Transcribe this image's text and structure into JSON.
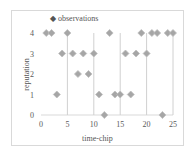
{
  "chart_data": {
    "type": "scatter",
    "title": "",
    "xlabel": "time-chip",
    "ylabel": "reputation",
    "xlim": [
      0,
      25
    ],
    "ylim": [
      0,
      4
    ],
    "xticks": [
      0,
      5,
      10,
      15,
      20,
      25
    ],
    "yticks": [
      0,
      1,
      2,
      3,
      4
    ],
    "grid": "vertical lines at x=5,10,15,20,25",
    "legend": {
      "position": "top",
      "entries": [
        "observations"
      ]
    },
    "marker": "diamond",
    "series": [
      {
        "name": "observations",
        "color": "#a6a6a6",
        "x": [
          1,
          2,
          3,
          4,
          5,
          6,
          7,
          8,
          9,
          10,
          11,
          12,
          13,
          14,
          15,
          16,
          17,
          18,
          19,
          20,
          21,
          22,
          23,
          24,
          25
        ],
        "y": [
          4,
          4,
          1,
          3,
          4,
          3,
          2,
          3,
          2,
          3,
          1,
          0,
          4,
          1,
          1,
          3,
          1,
          3,
          4,
          3,
          4,
          4,
          0,
          4,
          4
        ]
      }
    ]
  },
  "legend_label": "◆ observations",
  "axis": {
    "xlabel": "time-chip",
    "ylabel": "reputation"
  }
}
